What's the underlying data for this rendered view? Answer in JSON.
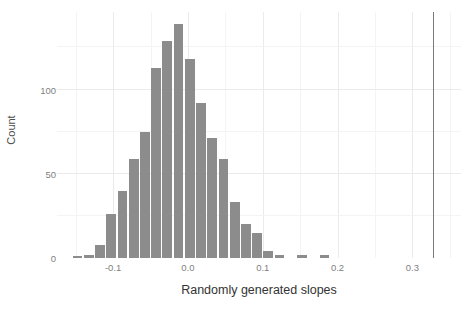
{
  "chart_data": {
    "type": "bar",
    "title": "",
    "subtitle": "",
    "xlabel": "Randomly generated slopes",
    "ylabel": "Count",
    "grid": true,
    "legend": null,
    "xlim": [
      -0.175,
      0.365
    ],
    "ylim": [
      0,
      146
    ],
    "xticks": [
      -0.1,
      0.0,
      0.1,
      0.2,
      0.3
    ],
    "xtick_labels": [
      "-0.1",
      "0.0",
      "0.1",
      "0.2",
      "0.3"
    ],
    "yticks": [
      0,
      50,
      100
    ],
    "ytick_labels": [
      "0",
      "50",
      "100"
    ],
    "bin_width": 0.015,
    "bin_starts": [
      -0.155,
      -0.14,
      -0.125,
      -0.11,
      -0.095,
      -0.08,
      -0.065,
      -0.05,
      -0.035,
      -0.02,
      -0.005,
      0.01,
      0.025,
      0.04,
      0.055,
      0.07,
      0.085,
      0.1,
      0.115,
      0.13,
      0.145,
      0.16,
      0.175
    ],
    "bin_centers": [
      -0.1475,
      -0.1325,
      -0.1175,
      -0.1025,
      -0.0875,
      -0.0725,
      -0.0575,
      -0.0425,
      -0.0275,
      -0.0125,
      0.0025,
      0.0175,
      0.0325,
      0.0475,
      0.0625,
      0.0775,
      0.0925,
      0.1075,
      0.1225,
      0.1375,
      0.1525,
      0.1675,
      0.1825
    ],
    "values": [
      1,
      2,
      8,
      26,
      40,
      59,
      75,
      113,
      129,
      139,
      118,
      92,
      71,
      59,
      33,
      20,
      15,
      4,
      2,
      0,
      2,
      0,
      2
    ],
    "bar_color": "#8c8c8c",
    "annotations": [
      {
        "name": "observed-slope-reference-line",
        "type": "vline",
        "x": 0.328,
        "color": "#7a7a7a"
      }
    ]
  },
  "theme": {
    "panel_background": "#ffffff",
    "grid_major_color": "#ebebeb",
    "grid_minor_color": "#f4f4f4",
    "tick_label_color": "#7f7f7f",
    "axis_title_color": "#333333"
  }
}
